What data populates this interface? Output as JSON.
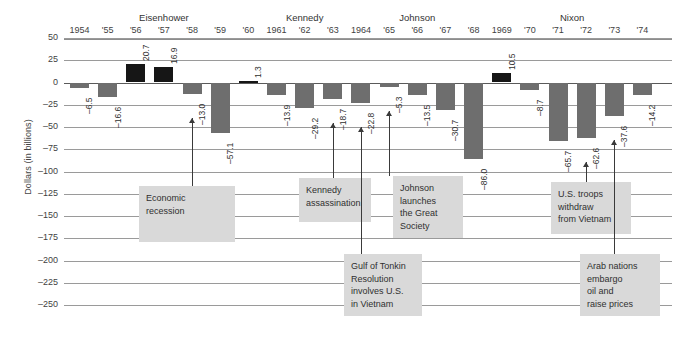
{
  "chart_data": {
    "type": "bar",
    "title": "",
    "ylabel": "Dollars (in billions)",
    "xlabel": "",
    "ylim": [
      -250,
      50
    ],
    "yticks": [
      "50",
      "25",
      "0",
      "–25",
      "–50",
      "–75",
      "–100",
      "–125",
      "–150",
      "–175",
      "–200",
      "–225",
      "–250"
    ],
    "grid": true,
    "legend": "none",
    "categories": [
      "1954",
      "'55",
      "'56",
      "'57",
      "'58",
      "'59",
      "'60",
      "1961",
      "'62",
      "'63",
      "1964",
      "'65",
      "'66",
      "'67",
      "'68",
      "1969",
      "'70",
      "'71",
      "'72",
      "'73",
      "'74"
    ],
    "values": [
      -6.5,
      -16.6,
      20.7,
      16.9,
      -13.0,
      -57.1,
      1.3,
      -13.9,
      -29.2,
      -18.7,
      -22.8,
      -5.3,
      -13.5,
      -30.7,
      -86.0,
      10.5,
      -8.7,
      -65.7,
      -62.6,
      -37.6,
      -14.2
    ],
    "value_labels": [
      "–6.5",
      "–16.6",
      "20.7",
      "16.9",
      "–13.0",
      "–57.1",
      "1.3",
      "–13.9",
      "–29.2",
      "–18.7",
      "–22.8",
      "–5.3",
      "–13.5",
      "–30.7",
      "–86.0",
      "10.5",
      "–8.7",
      "–65.7",
      "–62.6",
      "–37.6",
      "–14.2"
    ],
    "colors": {
      "positive": "#161616",
      "negative": "#6e6e6e",
      "grid": "#9a9a9a",
      "note_bg": "#d9d9d9"
    },
    "groups": [
      {
        "label": "Eisenhower",
        "start": 0,
        "end": 6
      },
      {
        "label": "Kennedy",
        "start": 7,
        "end": 9
      },
      {
        "label": "Johnson",
        "start": 10,
        "end": 14
      },
      {
        "label": "Nixon",
        "start": 15,
        "end": 20
      }
    ],
    "annotations": [
      {
        "text": "Economic\nrecession",
        "target_index": 4,
        "x": 139,
        "y": 186,
        "w": 96,
        "h": 56
      },
      {
        "text": "Kennedy\nassassination",
        "target_index": 9,
        "x": 299,
        "y": 178,
        "w": 72,
        "h": 44
      },
      {
        "text": "Johnson\nlaunches\nthe Great\nSociety",
        "target_index": 11,
        "x": 393,
        "y": 176,
        "w": 70,
        "h": 62
      },
      {
        "text": "Gulf of Tonkin\nResolution\ninvolves U.S.\nin Vietnam",
        "target_index": 10,
        "x": 344,
        "y": 254,
        "w": 78,
        "h": 62
      },
      {
        "text": "U.S. troops\nwithdraw\nfrom Vietnam",
        "target_index": 18,
        "x": 551,
        "y": 182,
        "w": 80,
        "h": 52
      },
      {
        "text": "Arab nations\nembargo\noil and\nraise prices",
        "target_index": 19,
        "x": 580,
        "y": 254,
        "w": 80,
        "h": 62
      }
    ]
  }
}
